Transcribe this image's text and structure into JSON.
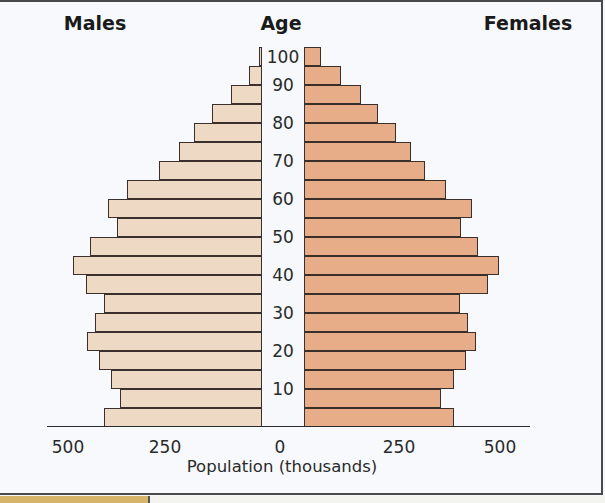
{
  "chart_data": {
    "type": "bar",
    "subtype": "population-pyramid",
    "title": "",
    "headers": {
      "left": "Males",
      "center": "Age",
      "right": "Females"
    },
    "xlabel": "Population (thousands)",
    "ylabel": "Age",
    "x_ticks_left": [
      "500",
      "250",
      "0"
    ],
    "x_ticks_right": [
      "250",
      "500"
    ],
    "xlim": [
      -500,
      500
    ],
    "age_tick_labels": [
      "100",
      "90",
      "80",
      "70",
      "60",
      "50",
      "40",
      "30",
      "20",
      "10"
    ],
    "categories": [
      "95-99",
      "90-94",
      "85-89",
      "80-84",
      "75-79",
      "70-74",
      "65-69",
      "60-64",
      "55-59",
      "50-54",
      "45-49",
      "40-44",
      "35-39",
      "30-34",
      "25-29",
      "20-24",
      "15-19",
      "10-14",
      "5-9",
      "0-4"
    ],
    "series": [
      {
        "name": "Males",
        "color": "#eed9c5",
        "values": [
          8,
          34,
          80,
          129,
          175,
          214,
          265,
          348,
          397,
          374,
          443,
          487,
          454,
          407,
          430,
          451,
          420,
          389,
          366,
          407
        ]
      },
      {
        "name": "Females",
        "color": "#e6ad88",
        "values": [
          43,
          94,
          145,
          188,
          234,
          272,
          307,
          360,
          426,
          398,
          442,
          495,
          467,
          396,
          416,
          437,
          411,
          381,
          348,
          381
        ]
      }
    ],
    "grid": false,
    "legend": "none"
  },
  "caption": {
    "visible": "partially cropped"
  }
}
